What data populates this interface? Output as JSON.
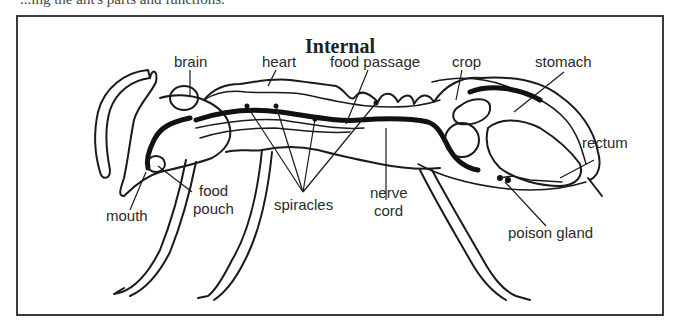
{
  "caption_partial": "...ing the ant's parts and functions.",
  "diagram": {
    "title": "Internal",
    "labels": {
      "brain": "brain",
      "heart": "heart",
      "food_passage": "food passage",
      "crop": "crop",
      "stomach": "stomach",
      "rectum": "rectum",
      "mouth": "mouth",
      "food_pouch_line1": "food",
      "food_pouch_line2": "pouch",
      "spiracles": "spiracles",
      "nerve_cord_line1": "nerve",
      "nerve_cord_line2": "cord",
      "poison_gland": "poison gland"
    }
  }
}
